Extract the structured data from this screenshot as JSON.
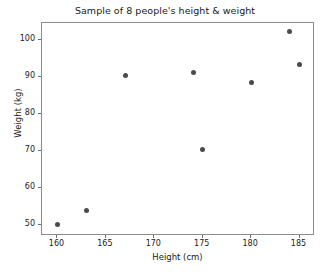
{
  "chart_data": {
    "type": "scatter",
    "title": "Sample of 8 people's height & weight",
    "xlabel": "Height (cm)",
    "ylabel": "Weight (kg)",
    "xlim": [
      158.4,
      186.6
    ],
    "ylim": [
      47.0,
      104.5
    ],
    "xticks": [
      160,
      165,
      170,
      175,
      180,
      185
    ],
    "yticks": [
      50,
      60,
      70,
      80,
      90,
      100
    ],
    "xticklabels": [
      "160",
      "165",
      "170",
      "175",
      "180",
      "185"
    ],
    "yticklabels": [
      "50",
      "60",
      "70",
      "80",
      "90",
      "100"
    ],
    "grid": false,
    "legend": false,
    "marker_color": "#4a4a4a",
    "frame_color": "#8c8c8c",
    "x": [
      160.0,
      163.0,
      167.0,
      174.0,
      175.0,
      180.0,
      184.0,
      185.0
    ],
    "y": [
      50.0,
      54.0,
      90.2,
      91.2,
      70.4,
      88.4,
      102.2,
      93.4
    ],
    "points": [
      {
        "height": 160.0,
        "weight": 50.0
      },
      {
        "height": 163.0,
        "weight": 54.0
      },
      {
        "height": 167.0,
        "weight": 90.2
      },
      {
        "height": 174.0,
        "weight": 91.2
      },
      {
        "height": 175.0,
        "weight": 70.4
      },
      {
        "height": 180.0,
        "weight": 88.4
      },
      {
        "height": 184.0,
        "weight": 102.2
      },
      {
        "height": 185.0,
        "weight": 93.4
      }
    ]
  }
}
